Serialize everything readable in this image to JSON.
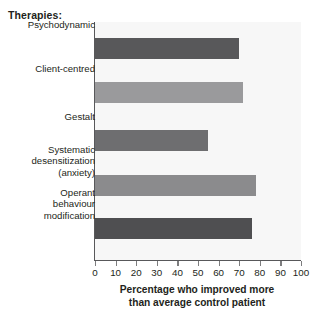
{
  "chart_data": {
    "type": "bar",
    "orientation": "horizontal",
    "title": "",
    "legend_title": "Therapies:",
    "categories": [
      "Psychodynamic",
      "Client-centred",
      "Gestalt",
      "Systematic desensitization (anxiety)",
      "Operant behaviour modification"
    ],
    "category_lines": [
      [
        "Psychodynamic"
      ],
      [
        "Client-centred"
      ],
      [
        "Gestalt"
      ],
      [
        "Systematic",
        "desensitization",
        "(anxiety)"
      ],
      [
        "Operant",
        "behaviour",
        "modification"
      ]
    ],
    "values": [
      70,
      72,
      55,
      78,
      76
    ],
    "bar_colors": [
      "#58585a",
      "#9a9a9c",
      "#6e6e70",
      "#8b8b8d",
      "#4f4f51"
    ],
    "xlabel_lines": [
      "Percentage who improved more",
      "than average control patient"
    ],
    "xlabel": "Percentage who improved more than average control patient",
    "ylabel": "",
    "xlim": [
      0,
      100
    ],
    "xticks": [
      0,
      10,
      20,
      30,
      40,
      50,
      60,
      70,
      80,
      90,
      100
    ],
    "xtick_labels": [
      "0",
      "10",
      "20",
      "30",
      "40",
      "50",
      "60",
      "70",
      "80",
      "90",
      "100"
    ],
    "grid": false,
    "legend_position": "none",
    "plot_background": "#f7f7f7",
    "axis_color": "#58585a"
  }
}
